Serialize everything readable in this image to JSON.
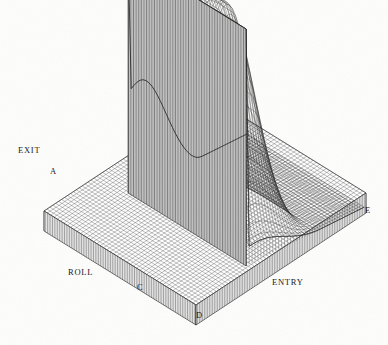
{
  "figure": {
    "kind": "3d-surface-wireframe",
    "title": "",
    "background_color": "#fdfdfc",
    "ink_color": "#1a1a1a",
    "width": 388,
    "height": 345
  },
  "labels": {
    "exit": "EXIT",
    "roll": "ROLL",
    "entry": "ENTRY",
    "corner_a": "A",
    "corner_c": "C",
    "corner_d": "D",
    "corner_e": "E"
  },
  "label_positions": {
    "exit": {
      "x": 18,
      "y": 146
    },
    "roll": {
      "x": 68,
      "y": 268
    },
    "entry": {
      "x": 272,
      "y": 278
    },
    "corner_a": {
      "x": 50,
      "y": 167
    },
    "corner_c": {
      "x": 137,
      "y": 283
    },
    "corner_d": {
      "x": 196,
      "y": 311
    },
    "corner_e": {
      "x": 365,
      "y": 206
    }
  },
  "chart_data": {
    "type": "surface",
    "title": "",
    "xlabel": "ENTRY",
    "ylabel": "ROLL",
    "zlabel": "",
    "axis_annotations": [
      "EXIT",
      "ROLL",
      "ENTRY"
    ],
    "corner_markers": [
      "A",
      "C",
      "D",
      "E"
    ],
    "grid": true,
    "legend": "none",
    "mesh": {
      "nx": 58,
      "ny": 46,
      "line_width": 0.35
    },
    "projection": {
      "type": "oblique-isometric",
      "origin_x": 196,
      "origin_y": 291,
      "u_dx": -2.62,
      "u_dy": -1.62,
      "v_dx": 2.95,
      "v_dy": -1.47,
      "z_scale": 237
    },
    "base_slab": {
      "corner_front": {
        "x": 196,
        "y": 305
      },
      "corner_left": {
        "x": 44,
        "y": 211
      },
      "corner_right": {
        "x": 366,
        "y": 193
      },
      "thickness_px": 20,
      "hatch": "vertical-fine"
    },
    "x": [
      0.0,
      0.0175,
      0.0351,
      0.0526,
      0.0702,
      0.0877,
      0.1053,
      0.1228,
      0.1404,
      0.1579,
      0.1754,
      0.193,
      0.2105,
      0.2281,
      0.2456,
      0.2632,
      0.2807,
      0.2982,
      0.3158,
      0.3333,
      0.3509,
      0.3684,
      0.386,
      0.4035,
      0.4211,
      0.4386,
      0.4561,
      0.4737,
      0.4912,
      0.5088,
      0.5263,
      0.5439,
      0.5614,
      0.5789,
      0.5965,
      0.614,
      0.6316,
      0.6491,
      0.6667,
      0.6842,
      0.7018,
      0.7193,
      0.7368,
      0.7544,
      0.7719,
      0.7895,
      0.807,
      0.8246,
      0.8421,
      0.8596,
      0.8772,
      0.8947,
      0.9123,
      0.9298,
      0.9474,
      0.9649,
      0.9825,
      1.0
    ],
    "y": [
      0.0,
      0.0222,
      0.0444,
      0.0667,
      0.0889,
      0.1111,
      0.1333,
      0.1556,
      0.1778,
      0.2,
      0.2222,
      0.2444,
      0.2667,
      0.2889,
      0.3111,
      0.3333,
      0.3556,
      0.3778,
      0.4,
      0.4222,
      0.4444,
      0.4667,
      0.4889,
      0.5111,
      0.5333,
      0.5556,
      0.5778,
      0.6,
      0.6222,
      0.6444,
      0.6667,
      0.6889,
      0.7111,
      0.7333,
      0.7556,
      0.7778,
      0.8,
      0.8222,
      0.8444,
      0.8667,
      0.8889,
      0.9111,
      0.9333,
      0.9556,
      0.9778,
      1.0
    ],
    "z_description": "Rolling-mill pressure-hill surface. Value is ~0 over the ENTRY plain (right/far region), rises over a rounded ridge toward the centre, then terminates in a tall near-vertical cliff wall on the EXIT (left) side whose crest is the maximum. A sharp crease/valley runs from the cliff top down toward corner C.",
    "z_range": [
      0.0,
      1.0
    ],
    "z_features": {
      "plateau_level": 0.0,
      "ridge_peak": 0.86,
      "cliff_crest": 1.0,
      "cliff_base": 0.0,
      "cliff_x_position": 0.3,
      "crease_y_position": 0.34
    },
    "regions": [
      {
        "name": "EXIT wall",
        "location": "left",
        "z": 1.0,
        "style": "vertical-ruled"
      },
      {
        "name": "pressure hill",
        "location": "centre-right",
        "z_max": 0.86,
        "style": "cross-mesh"
      },
      {
        "name": "ENTRY plain",
        "location": "right/front",
        "z": 0.0,
        "style": "cross-mesh"
      },
      {
        "name": "ROLL plain",
        "location": "left/front",
        "z": 0.0,
        "style": "cross-mesh"
      }
    ]
  }
}
